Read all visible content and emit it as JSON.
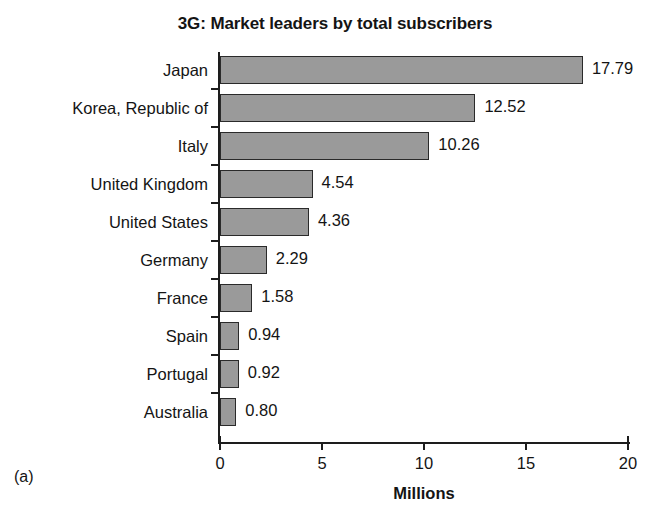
{
  "figure": {
    "caption": "(a)"
  },
  "chart_data": {
    "type": "bar",
    "orientation": "horizontal",
    "title": "3G: Market leaders by total subscribers",
    "xlabel": "Millions",
    "ylabel": "",
    "categories": [
      "Japan",
      "Korea, Republic of",
      "Italy",
      "United Kingdom",
      "United States",
      "Germany",
      "France",
      "Spain",
      "Portugal",
      "Australia"
    ],
    "values": [
      17.79,
      12.52,
      10.26,
      4.54,
      4.36,
      2.29,
      1.58,
      0.94,
      0.92,
      0.8
    ],
    "value_labels": [
      "17.79",
      "12.52",
      "10.26",
      "4.54",
      "4.36",
      "2.29",
      "1.58",
      "0.94",
      "0.92",
      "0.80"
    ],
    "xlim": [
      0,
      20
    ],
    "xticks": [
      0,
      5,
      10,
      15,
      20
    ],
    "xtick_labels": [
      "0",
      "5",
      "10",
      "15",
      "20"
    ],
    "grid": false,
    "legend": null,
    "bar_color": "#9a9a9a",
    "bar_edge_color": "#2a2a2a",
    "text_color": "#141414"
  }
}
